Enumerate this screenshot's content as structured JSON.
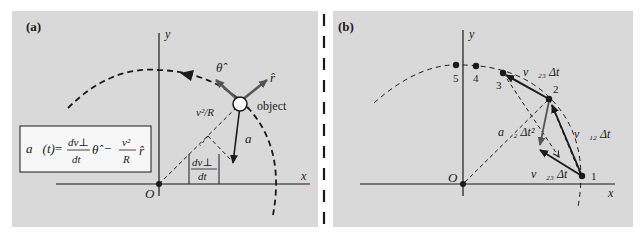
{
  "colors": {
    "panel_bg": "#d9d9d9",
    "page_bg": "#ffffff",
    "ink": "#1a1a1a",
    "formula_box_bg": "#f7f7f7",
    "grey_vector": "#555555"
  },
  "panel_a": {
    "label": "(a)",
    "axis_x": "x",
    "axis_y": "y",
    "origin": "O",
    "object_label": "object",
    "theta_hat": "θ̂",
    "r_hat": "r̂",
    "centripetal_label": "v²/R",
    "accel_label": "a⃗",
    "tangential_num": "dv⊥",
    "tangential_den": "dt",
    "formula": {
      "lhs": "a⃗(t)",
      "eq": "=",
      "term1_num": "dv⊥",
      "term1_den": "dt",
      "term1_unit": "θ̂",
      "minus": "−",
      "term2_num": "v²",
      "term2_den": "R",
      "term2_unit": "r̂"
    }
  },
  "panel_b": {
    "label": "(b)",
    "axis_x": "x",
    "axis_y": "y",
    "origin": "O",
    "points": [
      "1",
      "2",
      "3",
      "4",
      "5"
    ],
    "v23_top": "v⃗₂₃ Δt",
    "v23_bottom": "v⃗₂₃ Δt",
    "v12": "v⃗₁₂ Δt",
    "a2": "a⃗₂ Δt²"
  }
}
